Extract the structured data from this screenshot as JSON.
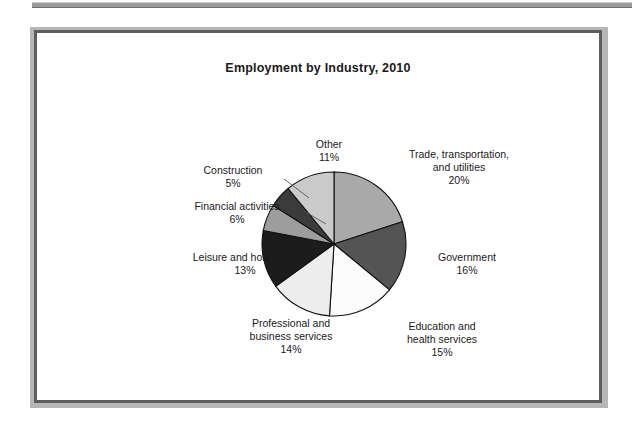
{
  "figure": {
    "title": "Employment by Industry, 2010"
  },
  "chart_data": {
    "type": "pie",
    "title": "Employment by Industry, 2010",
    "xlabel": "",
    "ylabel": "",
    "legend_position": "none",
    "grid": false,
    "start_angle_deg": 0,
    "direction": "clockwise",
    "categories": [
      "Trade, transportation, and utilities",
      "Government",
      "Education and health services",
      "Professional and business services",
      "Leisure and hospitality",
      "Financial activities",
      "Construction",
      "Other"
    ],
    "values": [
      20,
      16,
      15,
      14,
      13,
      6,
      5,
      11
    ],
    "value_labels": [
      "20%",
      "16%",
      "15%",
      "14%",
      "13%",
      "6%",
      "5%",
      "11%"
    ],
    "colors": [
      "#a9a9a9",
      "#545454",
      "#fcfcfc",
      "#ededed",
      "#1c1c1c",
      "#9d9d9d",
      "#3b3b3b",
      "#cacaca"
    ],
    "slices": [
      {
        "name": "Trade, transportation, and utilities",
        "value": 20,
        "value_label": "20%",
        "color": "#a9a9a9",
        "label_line1": "Trade, transportation,",
        "label_line2": "and utilities",
        "label_line3": "20%"
      },
      {
        "name": "Government",
        "value": 16,
        "value_label": "16%",
        "color": "#545454",
        "label_line1": "Government",
        "label_line2": "16%",
        "label_line3": ""
      },
      {
        "name": "Education and health services",
        "value": 15,
        "value_label": "15%",
        "color": "#fcfcfc",
        "label_line1": "Education and",
        "label_line2": "health services",
        "label_line3": "15%"
      },
      {
        "name": "Professional and business services",
        "value": 14,
        "value_label": "14%",
        "color": "#ededed",
        "label_line1": "Professional and",
        "label_line2": "business services",
        "label_line3": "14%"
      },
      {
        "name": "Leisure and hospitality",
        "value": 13,
        "value_label": "13%",
        "color": "#1c1c1c",
        "label_line1": "Leisure and hospitality",
        "label_line2": "13%",
        "label_line3": ""
      },
      {
        "name": "Financial activities",
        "value": 6,
        "value_label": "6%",
        "color": "#9d9d9d",
        "label_line1": "Financial activities",
        "label_line2": "6%",
        "label_line3": ""
      },
      {
        "name": "Construction",
        "value": 5,
        "value_label": "5%",
        "color": "#3b3b3b",
        "label_line1": "Construction",
        "label_line2": "5%",
        "label_line3": ""
      },
      {
        "name": "Other",
        "value": 11,
        "value_label": "11%",
        "color": "#cacaca",
        "label_line1": "Other",
        "label_line2": "11%",
        "label_line3": ""
      }
    ]
  }
}
